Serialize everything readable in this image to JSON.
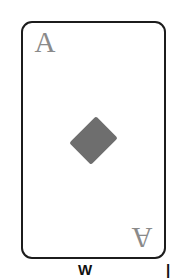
{
  "scene": {
    "background_color": "#ffffff",
    "subject": "playing-card"
  },
  "card": {
    "rank": "A",
    "suit_name": "diamonds",
    "suit_symbol": "♦",
    "border_color": "#1c1c1c",
    "face_color": "#ffffff",
    "pip_color": "#6e6e6e",
    "rank_color": "#8a8a8a",
    "corner_top_left": {
      "rank": "A",
      "pip": "♦"
    },
    "corner_bottom_right": {
      "rank": "A",
      "pip": "♦"
    },
    "center_pip_count": 1
  },
  "caption": {
    "fragment_center": "W",
    "fragment_right": "|",
    "color": "#111111"
  }
}
